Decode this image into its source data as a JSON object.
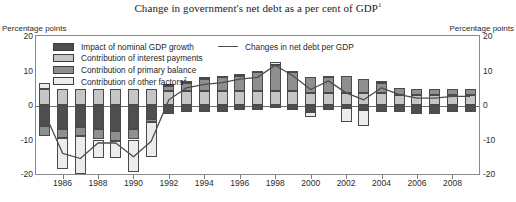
{
  "header": {
    "title": "Change in government's net debt as a per cent of GDP",
    "title_superscript": "1",
    "unit_left": "Percentage points",
    "unit_right": "Percentage points"
  },
  "legend": {
    "items": [
      {
        "label": "Impact of nominal GDP growth",
        "color": "#4f4f4f",
        "superscript": ""
      },
      {
        "label": "Contribution of interest payments",
        "color": "#c6c6c6",
        "superscript": ""
      },
      {
        "label": "Contribution of primary balance",
        "color": "#8f8f8f",
        "superscript": ""
      },
      {
        "label": "Contribution of other factors",
        "color": "#ececec",
        "superscript": "2"
      }
    ],
    "line_item": {
      "label": "Changes in net debt per GDP",
      "color": "#4d4d4d"
    }
  },
  "chart_data": {
    "type": "bar",
    "stacked": true,
    "title": "Change in government's net debt as a per cent of GDP",
    "xlabel": "",
    "ylabel": "Percentage points",
    "ylim": [
      -20,
      20
    ],
    "yticks": [
      20,
      10,
      0,
      -10,
      -20
    ],
    "grid": false,
    "legend_position": "top-left",
    "x": [
      1985,
      1986,
      1987,
      1988,
      1989,
      1990,
      1991,
      1992,
      1993,
      1994,
      1995,
      1996,
      1997,
      1998,
      1999,
      2000,
      2001,
      2002,
      2003,
      2004,
      2005,
      2006,
      2007,
      2008,
      2009
    ],
    "xtick_labels": [
      1986,
      1988,
      1990,
      1992,
      1994,
      1996,
      1998,
      2000,
      2002,
      2004,
      2006,
      2008
    ],
    "series": [
      {
        "name": "Impact of nominal GDP growth",
        "color": "#4f4f4f",
        "values": [
          -6.0,
          -7.0,
          -6.5,
          -7.0,
          -7.5,
          -7.0,
          -4.0,
          -2.5,
          -2.0,
          -2.0,
          -2.0,
          -1.5,
          -1.5,
          -1.0,
          -1.5,
          -2.0,
          -1.5,
          -1.0,
          -1.5,
          -2.0,
          -2.0,
          -2.5,
          -2.5,
          -2.0,
          -2.0
        ]
      },
      {
        "name": "Contribution of interest payments",
        "color": "#c6c6c6",
        "values": [
          4.5,
          4.5,
          4.5,
          4.5,
          4.5,
          4.5,
          4.5,
          4.0,
          4.0,
          4.0,
          4.0,
          4.0,
          4.0,
          4.0,
          4.0,
          3.5,
          3.5,
          3.5,
          3.5,
          3.5,
          3.0,
          3.0,
          3.0,
          3.0,
          3.0
        ]
      },
      {
        "name": "Contribution of primary balance",
        "color": "#8f8f8f",
        "values": [
          -3.0,
          -2.5,
          -2.5,
          -3.0,
          -3.0,
          -3.0,
          -1.0,
          1.5,
          2.5,
          3.5,
          4.0,
          4.5,
          5.5,
          7.5,
          5.5,
          4.5,
          4.5,
          5.0,
          4.0,
          3.0,
          2.0,
          1.5,
          1.5,
          1.5,
          1.5
        ]
      },
      {
        "name": "Contribution of other factors",
        "color": "#ececec",
        "values": [
          2.0,
          -9.0,
          -11.0,
          -5.5,
          -5.0,
          -9.5,
          -10.0,
          0.5,
          0.5,
          0.5,
          0.5,
          0.5,
          0.5,
          1.0,
          0.5,
          -1.5,
          0.5,
          -4.0,
          -4.5,
          0.5,
          0.0,
          0.0,
          0.0,
          0.0,
          0.0
        ]
      }
    ],
    "line_series": {
      "name": "Changes in net debt per GDP",
      "color": "#4d4d4d",
      "values": [
        -2.5,
        -14.0,
        -15.5,
        -11.0,
        -11.0,
        -15.0,
        -10.5,
        1.5,
        5.0,
        6.0,
        6.5,
        7.5,
        8.0,
        11.5,
        8.5,
        4.5,
        7.0,
        3.5,
        1.5,
        5.0,
        3.0,
        2.0,
        2.0,
        2.5,
        2.5
      ]
    }
  }
}
